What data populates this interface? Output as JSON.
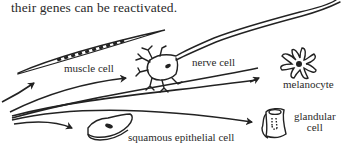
{
  "caption": "their genes can be reactivated.",
  "cells": [
    {
      "id": "muscle",
      "label": "muscle cell"
    },
    {
      "id": "nerve",
      "label": "nerve cell"
    },
    {
      "id": "melanocyte",
      "label": "melanocyte"
    },
    {
      "id": "squamous",
      "label": "squamous epithelial cell"
    },
    {
      "id": "glandular",
      "label_line1": "glandular",
      "label_line2": "cell"
    }
  ],
  "colors": {
    "ink": "#222222",
    "background": "#ffffff"
  }
}
